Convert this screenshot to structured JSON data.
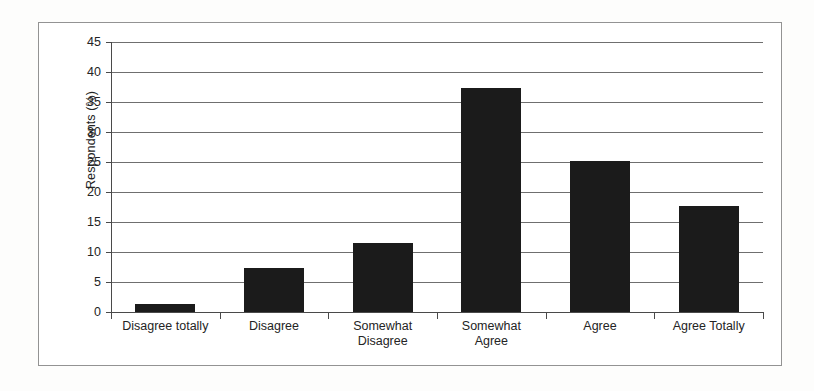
{
  "chart_data": {
    "type": "bar",
    "title": "",
    "subtitle": "",
    "xlabel": "",
    "ylabel": "Respondents (%)",
    "categories": [
      "Disagree totally",
      "Disagree",
      "Somewhat Disagree",
      "Somewhat Agree",
      "Agree",
      "Agree Totally"
    ],
    "category_lines": [
      [
        "Disagree totally"
      ],
      [
        "Disagree"
      ],
      [
        "Somewhat",
        "Disagree"
      ],
      [
        "Somewhat",
        "Agree"
      ],
      [
        "Agree"
      ],
      [
        "Agree Totally"
      ]
    ],
    "values": [
      1.3,
      7.4,
      11.5,
      37.3,
      25.1,
      17.6
    ],
    "ylim": [
      0,
      45
    ],
    "ytick_labels": [
      "45",
      "40",
      "35",
      "30",
      "25",
      "20",
      "15",
      "10",
      "5",
      "0"
    ],
    "yticks": [
      45,
      40,
      35,
      30,
      25,
      20,
      15,
      10,
      5,
      0
    ],
    "grid": true,
    "legend": "none",
    "bar_color": "#1b1b1b",
    "gridline_color": "#6f6f6f",
    "axis_color": "#4a4a4a",
    "frame_color": "#939393",
    "background_color": "#ffffff"
  }
}
